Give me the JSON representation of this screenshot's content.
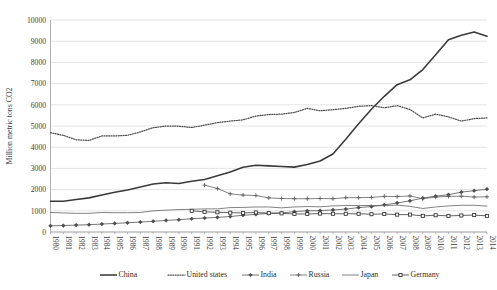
{
  "chart_data": {
    "type": "line",
    "title": "",
    "xlabel": "",
    "ylabel": "Million metric tons CO2",
    "ylim": [
      0,
      10000
    ],
    "ytick_step": 1000,
    "yticks": [
      "0",
      "1000",
      "2000",
      "3000",
      "4000",
      "5000",
      "6000",
      "7000",
      "8000",
      "9000",
      "10000"
    ],
    "grid": true,
    "legend_position": "bottom",
    "x": [
      1980,
      1981,
      1982,
      1983,
      1984,
      1985,
      1986,
      1987,
      1988,
      1989,
      1990,
      1991,
      1992,
      1993,
      1994,
      1995,
      1996,
      1997,
      1998,
      1999,
      2000,
      2001,
      2002,
      2003,
      2004,
      2005,
      2006,
      2007,
      2008,
      2009,
      2010,
      2011,
      2012,
      2013,
      2014
    ],
    "categories": [
      "1980",
      "1981",
      "1982",
      "1983",
      "1984",
      "1985",
      "1986",
      "1987",
      "1988",
      "1989",
      "1990",
      "1991",
      "1992",
      "1993",
      "1994",
      "1995",
      "1996",
      "1997",
      "1998",
      "1999",
      "2000",
      "2001",
      "2002",
      "2003",
      "2004",
      "2005",
      "2006",
      "2007",
      "2008",
      "2009",
      "2010",
      "2011",
      "2012",
      "2013",
      "2014"
    ],
    "series": [
      {
        "name": "China",
        "style": "solid-thick",
        "marker": "none",
        "color": "#3a3a3a",
        "values": [
          1448,
          1450,
          1530,
          1610,
          1750,
          1880,
          1980,
          2120,
          2260,
          2320,
          2290,
          2390,
          2480,
          2650,
          2830,
          3050,
          3150,
          3120,
          3090,
          3060,
          3180,
          3350,
          3680,
          4370,
          5110,
          5790,
          6400,
          6950,
          7180,
          7660,
          8360,
          9070,
          9280,
          9430,
          9230
        ]
      },
      {
        "name": "United states",
        "style": "dotted",
        "marker": "none",
        "color": "#4f4f4f",
        "values": [
          4680,
          4560,
          4350,
          4320,
          4530,
          4530,
          4560,
          4720,
          4920,
          5000,
          4990,
          4930,
          5040,
          5160,
          5230,
          5290,
          5470,
          5540,
          5560,
          5640,
          5830,
          5720,
          5770,
          5830,
          5930,
          5960,
          5860,
          5960,
          5780,
          5380,
          5560,
          5430,
          5230,
          5350,
          5380
        ]
      },
      {
        "name": "India",
        "style": "solid-thin",
        "marker": "diamond",
        "color": "#4a4a4a",
        "values": [
          290,
          305,
          325,
          345,
          375,
          405,
          435,
          470,
          505,
          545,
          580,
          625,
          660,
          690,
          730,
          790,
          830,
          880,
          900,
          960,
          1000,
          1010,
          1040,
          1080,
          1150,
          1200,
          1280,
          1370,
          1470,
          1600,
          1690,
          1760,
          1880,
          1950,
          2020
        ]
      },
      {
        "name": "Russia",
        "style": "solid-thin",
        "marker": "plus",
        "color": "#5a5a5a",
        "values": [
          null,
          null,
          null,
          null,
          null,
          null,
          null,
          null,
          null,
          null,
          null,
          null,
          2210,
          2050,
          1800,
          1740,
          1720,
          1610,
          1580,
          1570,
          1570,
          1580,
          1570,
          1620,
          1620,
          1630,
          1680,
          1670,
          1700,
          1570,
          1650,
          1680,
          1690,
          1650,
          1660
        ]
      },
      {
        "name": "Japan",
        "style": "solid-thin2",
        "marker": "none",
        "color": "#636363",
        "values": [
          920,
          900,
          880,
          880,
          920,
          910,
          910,
          920,
          1000,
          1030,
          1060,
          1070,
          1090,
          1090,
          1150,
          1160,
          1180,
          1180,
          1140,
          1180,
          1200,
          1190,
          1230,
          1250,
          1250,
          1250,
          1240,
          1270,
          1210,
          1110,
          1180,
          1230,
          1260,
          1260,
          1220
        ]
      },
      {
        "name": "Germany",
        "style": "solid-thin",
        "marker": "square",
        "color": "#2f2f2f",
        "values": [
          null,
          null,
          null,
          null,
          null,
          null,
          null,
          null,
          null,
          null,
          null,
          1000,
          950,
          930,
          910,
          900,
          920,
          890,
          880,
          850,
          850,
          870,
          860,
          860,
          860,
          840,
          850,
          820,
          820,
          760,
          790,
          760,
          780,
          800,
          760
        ]
      }
    ],
    "legend": [
      {
        "label": "China",
        "marker": "none",
        "style": "solid-thick"
      },
      {
        "label": "United states",
        "marker": "none",
        "style": "dotted"
      },
      {
        "label": "India",
        "marker": "diamond",
        "style": "solid-thin"
      },
      {
        "label": "Russia",
        "marker": "plus",
        "style": "solid-thin"
      },
      {
        "label": "Japan",
        "marker": "none",
        "style": "solid-thin2"
      },
      {
        "label": "Germany",
        "marker": "square",
        "style": "solid-thin"
      }
    ]
  },
  "colors": {
    "gridline": "#d9d9d9",
    "axis": "#9a9a9a",
    "text": "#3d3d3d",
    "background": "#ffffff"
  }
}
